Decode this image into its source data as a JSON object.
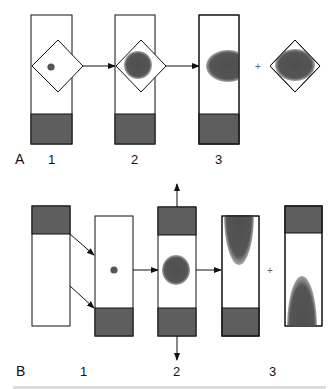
{
  "figure": {
    "colors": {
      "outline": "#111111",
      "dark_fill": "#5e5e5e",
      "blob_fill": "#505050",
      "blob_halo": "#9a9a9a",
      "background": "#ffffff"
    },
    "panel_a": {
      "label": "A",
      "steps": [
        {
          "label": "1",
          "description": "column with diamond region containing small dot, dark bottom segment"
        },
        {
          "label": "2",
          "description": "column with diamond region containing enlarged circle, dark bottom segment"
        },
        {
          "label": "3",
          "description": "column with oval clipped at right edge, dark bottom segment"
        }
      ],
      "plus_symbol": "+",
      "extra": "diamond region containing oval"
    },
    "panel_b": {
      "label": "B",
      "steps": [
        {
          "label": "1",
          "description": "source column with dark top segment; two arrows to second column with dot and dark bottom segment"
        },
        {
          "label": "2",
          "description": "column with dark top and bottom segments, circle in middle, arrows up and down"
        },
        {
          "label": "3",
          "description": "column with elongated blob from top and dark bottom segment"
        }
      ],
      "plus_symbol": "+",
      "extra": "column with dark top segment and elongated blob from bottom"
    }
  }
}
